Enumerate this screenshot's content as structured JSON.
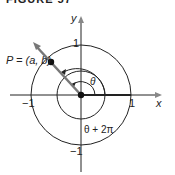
{
  "figure": {
    "title": "FIGURE 57",
    "axis_x_label": "x",
    "axis_y_label": "y",
    "tick_pos_x": "1",
    "tick_neg_x": "−1",
    "tick_pos_y": "1",
    "tick_neg_y": "−1",
    "point_label": "P = (a, b)",
    "angle_label": "θ",
    "angle_label_2": "θ + 2π",
    "colors": {
      "stroke": "#222222",
      "ray": "#777777"
    }
  }
}
